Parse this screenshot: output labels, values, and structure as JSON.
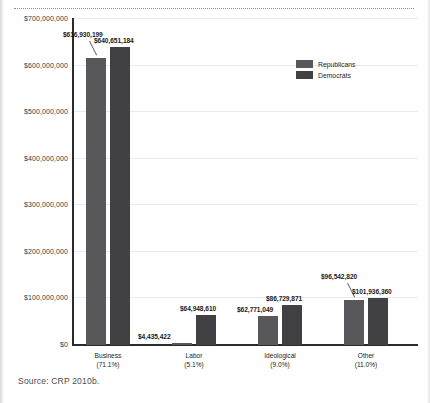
{
  "figure": {
    "source_note": "Source: CRP 2010b."
  },
  "chart_data": {
    "type": "bar",
    "title": "",
    "subtitle": "",
    "xlabel": "",
    "ylabel": "",
    "ylim": [
      0,
      700000000
    ],
    "grid": true,
    "legend_position": "top-right",
    "categories": [
      "Business",
      "Labor",
      "Ideological",
      "Other"
    ],
    "category_sublabels": [
      "(71.1%)",
      "(5.1%)",
      "(9.0%)",
      "(11.0%)"
    ],
    "category_share_pct": [
      71.1,
      5.1,
      9.0,
      11.0
    ],
    "ytick_labels": [
      "$700,000,000",
      "$600,000,000",
      "$500,000,000",
      "$400,000,000",
      "$300,000,000",
      "$200,000,000",
      "$100,000,000",
      "$0"
    ],
    "ytick_values": [
      700000000,
      600000000,
      500000000,
      400000000,
      300000000,
      200000000,
      100000000,
      0
    ],
    "series": [
      {
        "name": "Republicans",
        "color": "#58585a",
        "values": [
          616930199,
          4435422,
          62771049,
          96542820
        ],
        "value_labels": [
          "$616,930,199",
          "$4,435,422",
          "$62,771,049",
          "$96,542,820"
        ]
      },
      {
        "name": "Democrats",
        "color": "#414042",
        "values": [
          640651184,
          64948610,
          86729871,
          101936360
        ],
        "value_labels": [
          "$640,651,184",
          "$64,948,610",
          "$86,729,871",
          "$101,936,360"
        ]
      }
    ]
  }
}
